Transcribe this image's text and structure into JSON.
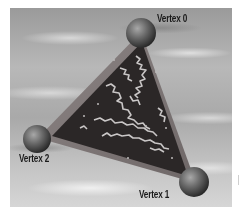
{
  "figure": {
    "background": "cloudy-sky",
    "triangle_fill": "dark-marbled-texture",
    "colors": {
      "sky_dark": "#9a9a9a",
      "sky_light": "#d6d6d6",
      "triangle_face": "#2a2a2a",
      "triangle_edge": "#8a8080",
      "marble_veins": "#c8c8c8",
      "sphere_highlight": "#9a9a9a",
      "sphere_shadow": "#2e2e2e",
      "label_text": "#1a1a1a"
    }
  },
  "vertices": [
    {
      "id": 0,
      "label": "Vertex 0",
      "sphere": "sphere-icon"
    },
    {
      "id": 1,
      "label": "Vertex 1",
      "sphere": "sphere-icon"
    },
    {
      "id": 2,
      "label": "Vertex 2",
      "sphere": "sphere-icon"
    }
  ]
}
